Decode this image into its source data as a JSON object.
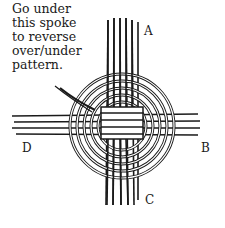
{
  "diagram": {
    "type": "basket-weaving-illustration",
    "caption": "Go under this spoke to reverse over/under pattern.",
    "caption_lines": [
      "Go under",
      "this spoke",
      "to reverse",
      "over/under",
      "pattern."
    ],
    "labels": {
      "A": "A",
      "B": "B",
      "C": "C",
      "D": "D"
    },
    "colors": {
      "ink": "#1a1a1a",
      "background": "#ffffff"
    }
  }
}
